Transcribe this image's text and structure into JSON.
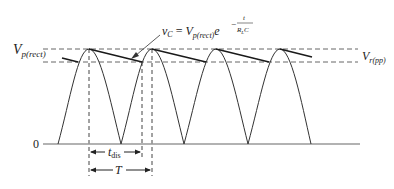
{
  "figure": {
    "labels": {
      "vp_rect_main": "V",
      "vp_rect_sub": "p(rect)",
      "vr_pp_main": "V",
      "vr_pp_sub": "r(pp)",
      "zero": "0",
      "t_dis_main": "t",
      "t_dis_sub": "dis",
      "period": "T"
    },
    "equation": {
      "lhs_main": "v",
      "lhs_sub": "C",
      "equals": "=",
      "rhs_main": "V",
      "rhs_sub": "p(rect)",
      "base": "e",
      "exp_minus": "−",
      "exp_num": "t",
      "exp_den_main": "R",
      "exp_den_sub": "L",
      "exp_den_tail": "C"
    },
    "colors": {
      "waveform": "#333333",
      "ripple": "#1a1a1a",
      "dashed": "#666666",
      "axis": "#999999"
    },
    "geometry": {
      "peak_y": 49,
      "ripple_low_y": 62,
      "baseline_y": 144,
      "peaks_x": [
        89,
        152,
        216,
        280
      ],
      "zeros_x": [
        58,
        121,
        184,
        248,
        311
      ]
    }
  }
}
